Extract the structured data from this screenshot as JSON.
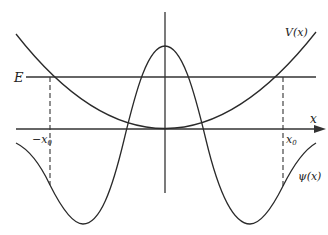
{
  "diagram": {
    "labels": {
      "energy": "E",
      "potential": "V(x)",
      "x_axis": "x",
      "neg_turning_point": "−x",
      "neg_turning_point_sub": "0",
      "pos_turning_point": "x",
      "pos_turning_point_sub": "0",
      "wavefunction": "ψ(x)"
    },
    "colors": {
      "line": "#2a2a2a",
      "background": "#ffffff"
    }
  }
}
